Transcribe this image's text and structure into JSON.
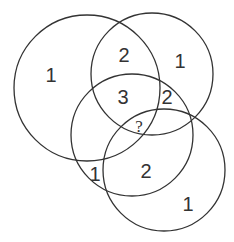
{
  "diagram": {
    "type": "venn-puzzle",
    "stroke_color": "#333333",
    "circles": [
      {
        "id": "A",
        "cx": 87,
        "cy": 88,
        "r": 73
      },
      {
        "id": "B",
        "cx": 152,
        "cy": 74,
        "r": 61
      },
      {
        "id": "C",
        "cx": 132,
        "cy": 135,
        "r": 61
      },
      {
        "id": "D",
        "cx": 164,
        "cy": 170,
        "r": 61
      }
    ],
    "labels": [
      {
        "text": "1",
        "x": 51,
        "y": 75
      },
      {
        "text": "2",
        "x": 124,
        "y": 55
      },
      {
        "text": "1",
        "x": 180,
        "y": 61
      },
      {
        "text": "3",
        "x": 123,
        "y": 97
      },
      {
        "text": "2",
        "x": 167,
        "y": 97
      },
      {
        "text": "?",
        "x": 139,
        "y": 126
      },
      {
        "text": "1",
        "x": 95,
        "y": 174
      },
      {
        "text": "2",
        "x": 146,
        "y": 171
      },
      {
        "text": "1",
        "x": 188,
        "y": 204
      }
    ]
  }
}
